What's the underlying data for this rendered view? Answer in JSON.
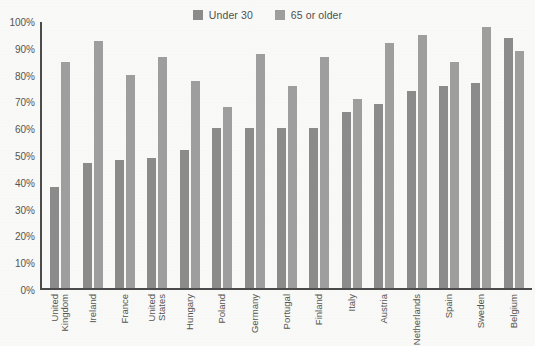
{
  "chart_data": {
    "type": "bar",
    "title": "",
    "subtitle": "",
    "xlabel": "",
    "ylabel": "",
    "ylim": [
      0,
      100
    ],
    "grid": false,
    "legend_position": "top-center",
    "y_ticks": [
      "100%",
      "90%",
      "80%",
      "70%",
      "60%",
      "50%",
      "40%",
      "30%",
      "20%",
      "10%",
      "0%"
    ],
    "y_tick_values": [
      100,
      90,
      80,
      70,
      60,
      50,
      40,
      30,
      20,
      10,
      0
    ],
    "categories": [
      "United Kingdom",
      "Ireland",
      "France",
      "United States",
      "Hungary",
      "Poland",
      "Germany",
      "Portugal",
      "Finland",
      "Italy",
      "Austria",
      "Netherlands",
      "Spain",
      "Sweden",
      "Belgium"
    ],
    "series": [
      {
        "name": "Under 30",
        "color": "#8b8b8b",
        "values": [
          38,
          47,
          48,
          49,
          52,
          60,
          60,
          60,
          60,
          66,
          69,
          74,
          76,
          77,
          94
        ]
      },
      {
        "name": "65 or older",
        "color": "#9e9e9e",
        "values": [
          85,
          93,
          80,
          87,
          78,
          68,
          88,
          76,
          87,
          71,
          92,
          95,
          85,
          98,
          89
        ]
      }
    ]
  },
  "legend": {
    "entries": [
      {
        "label": "Under 30"
      },
      {
        "label": "65 or older"
      }
    ]
  }
}
